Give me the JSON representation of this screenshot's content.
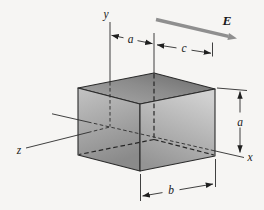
{
  "figure": {
    "axis_labels": {
      "y": "y",
      "z": "z",
      "x": "x"
    },
    "field_vector_label": "E",
    "dimension_labels": {
      "top_width_a": "a",
      "top_depth_c": "c",
      "side_height_a": "a",
      "bottom_width_b": "b"
    },
    "colors": {
      "background": "#f6f5f3",
      "line": "#2b2b2b",
      "field_arrow": "#8f8f8f",
      "face_top_light": "#a6a6a6",
      "face_top_dark": "#6e6e6e",
      "face_front_left_light": "#c2c2c2",
      "face_front_left_dark": "#8c8c8c",
      "face_front_right_light": "#d0d0d0",
      "face_front_right_dark": "#969696"
    }
  }
}
